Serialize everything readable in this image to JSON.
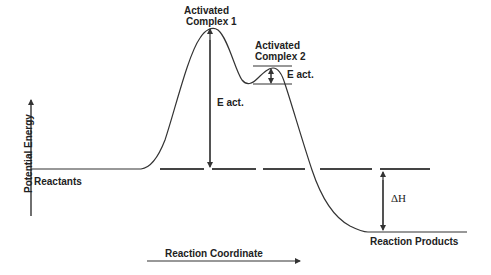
{
  "diagram": {
    "title": "",
    "y_axis_label": "Potential Energy",
    "x_axis_label": "Reaction Coordinate",
    "labels": {
      "reactants": "Reactants",
      "products": "Reaction Products",
      "complex1_line1": "Activated",
      "complex1_line2": "Complex 1",
      "complex2_line1": "Activated",
      "complex2_line2": "Complex 2",
      "eact1": "E act.",
      "eact2": "E act.",
      "delta_h": "ΔH"
    },
    "colors": {
      "line": "#333333",
      "text": "#222222",
      "background": "#ffffff"
    }
  }
}
